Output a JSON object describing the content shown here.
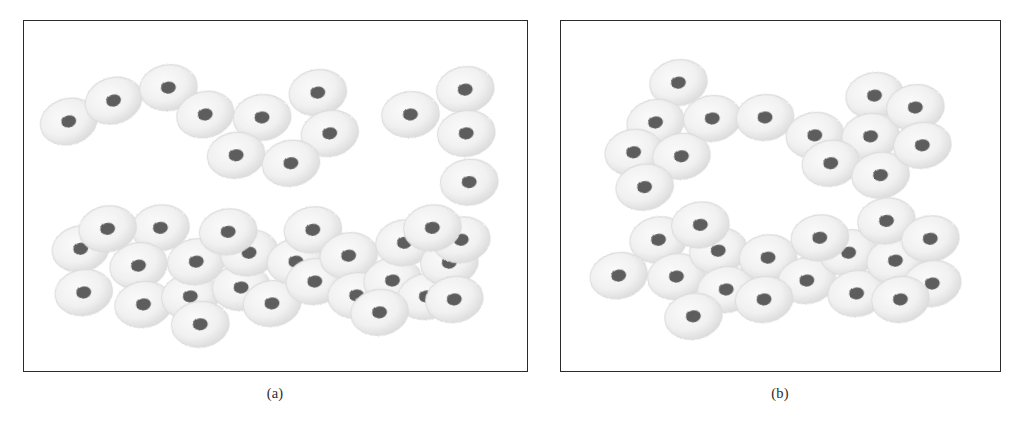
{
  "figure": {
    "background_color": "#ffffff",
    "border_color": "#2b2b2b",
    "cell_body_color": "#f1f1f1",
    "cell_edge_color": "#dcdcdc",
    "cell_nucleus_color": "#5d5d5d",
    "caption_color": "#2b2b2b",
    "cell_rx": 29,
    "cell_ry": 23,
    "nucleus_rx": 7.5,
    "nucleus_ry": 6.0
  },
  "panels": [
    {
      "id": "panel-a",
      "caption": "(a)",
      "frame": {
        "x": 23,
        "y": 20,
        "width": 505,
        "height": 352
      },
      "caption_box": {
        "x": 215,
        "y": 385,
        "width": 120
      },
      "cell_count": 39,
      "clusters": [
        {
          "name": "upper-left-chain",
          "cells": [
            {
              "cx": 68,
              "cy": 121,
              "rot": -16
            },
            {
              "cx": 113,
              "cy": 100,
              "rot": -18
            },
            {
              "cx": 168,
              "cy": 87,
              "rot": -8
            },
            {
              "cx": 205,
              "cy": 114,
              "rot": -14
            },
            {
              "cx": 262,
              "cy": 117,
              "rot": -6
            },
            {
              "cx": 318,
              "cy": 92,
              "rot": -10
            },
            {
              "cx": 330,
              "cy": 133,
              "rot": -12
            },
            {
              "cx": 236,
              "cy": 155,
              "rot": -8
            },
            {
              "cx": 291,
              "cy": 163,
              "rot": -10
            }
          ]
        },
        {
          "name": "upper-right-group",
          "cells": [
            {
              "cx": 411,
              "cy": 114,
              "rot": -6
            },
            {
              "cx": 466,
              "cy": 89,
              "rot": -10
            },
            {
              "cx": 467,
              "cy": 133,
              "rot": -8
            },
            {
              "cx": 470,
              "cy": 182,
              "rot": -6
            }
          ]
        },
        {
          "name": "lower-band",
          "cells": [
            {
              "cx": 80,
              "cy": 249,
              "rot": -12
            },
            {
              "cx": 83,
              "cy": 293,
              "rot": -10
            },
            {
              "cx": 160,
              "cy": 228,
              "rot": -8
            },
            {
              "cx": 138,
              "cy": 266,
              "rot": -12
            },
            {
              "cx": 143,
              "cy": 305,
              "rot": -10
            },
            {
              "cx": 190,
              "cy": 297,
              "rot": -8
            },
            {
              "cx": 196,
              "cy": 262,
              "rot": -10
            },
            {
              "cx": 241,
              "cy": 288,
              "rot": -6
            },
            {
              "cx": 249,
              "cy": 253,
              "rot": -10
            },
            {
              "cx": 272,
              "cy": 304,
              "rot": -8
            },
            {
              "cx": 296,
              "cy": 262,
              "rot": -8
            },
            {
              "cx": 313,
              "cy": 230,
              "rot": -10
            },
            {
              "cx": 315,
              "cy": 282,
              "rot": -8
            },
            {
              "cx": 349,
              "cy": 256,
              "rot": -10
            },
            {
              "cx": 357,
              "cy": 296,
              "rot": -6
            },
            {
              "cx": 393,
              "cy": 281,
              "rot": -10
            },
            {
              "cx": 405,
              "cy": 243,
              "rot": -8
            },
            {
              "cx": 427,
              "cy": 297,
              "rot": -10
            },
            {
              "cx": 450,
              "cy": 263,
              "rot": -8
            },
            {
              "cx": 455,
              "cy": 300,
              "rot": -10
            },
            {
              "cx": 462,
              "cy": 240,
              "rot": -8
            },
            {
              "cx": 228,
              "cy": 232,
              "rot": -8
            },
            {
              "cx": 380,
              "cy": 313,
              "rot": -8
            },
            {
              "cx": 107,
              "cy": 229,
              "rot": -10
            },
            {
              "cx": 433,
              "cy": 228,
              "rot": -8
            },
            {
              "cx": 200,
              "cy": 325,
              "rot": -6
            }
          ]
        }
      ]
    },
    {
      "id": "panel-b",
      "caption": "(b)",
      "frame": {
        "x": 560,
        "y": 20,
        "width": 441,
        "height": 352
      },
      "caption_box": {
        "x": 720,
        "y": 385,
        "width": 120
      },
      "cell_count": 32,
      "clusters": [
        {
          "name": "upper-horseshoe",
          "cells": [
            {
              "cx": 678,
              "cy": 82,
              "rot": -10
            },
            {
              "cx": 655,
              "cy": 122,
              "rot": -12
            },
            {
              "cx": 712,
              "cy": 118,
              "rot": -8
            },
            {
              "cx": 765,
              "cy": 117,
              "rot": -6
            },
            {
              "cx": 633,
              "cy": 152,
              "rot": -10
            },
            {
              "cx": 681,
              "cy": 156,
              "rot": -8
            },
            {
              "cx": 644,
              "cy": 187,
              "rot": -10
            },
            {
              "cx": 815,
              "cy": 135,
              "rot": -8
            },
            {
              "cx": 875,
              "cy": 95,
              "rot": -10
            },
            {
              "cx": 871,
              "cy": 136,
              "rot": -8
            },
            {
              "cx": 916,
              "cy": 107,
              "rot": -8
            },
            {
              "cx": 831,
              "cy": 163,
              "rot": -10
            },
            {
              "cx": 881,
              "cy": 175,
              "rot": -8
            },
            {
              "cx": 923,
              "cy": 145,
              "rot": -8
            }
          ]
        },
        {
          "name": "lower-horseshoe",
          "cells": [
            {
              "cx": 658,
              "cy": 240,
              "rot": -10
            },
            {
              "cx": 618,
              "cy": 276,
              "rot": -12
            },
            {
              "cx": 676,
              "cy": 277,
              "rot": -8
            },
            {
              "cx": 718,
              "cy": 251,
              "rot": -10
            },
            {
              "cx": 726,
              "cy": 290,
              "rot": -8
            },
            {
              "cx": 768,
              "cy": 258,
              "rot": -6
            },
            {
              "cx": 693,
              "cy": 317,
              "rot": -10
            },
            {
              "cx": 807,
              "cy": 281,
              "rot": -8
            },
            {
              "cx": 849,
              "cy": 253,
              "rot": -10
            },
            {
              "cx": 857,
              "cy": 294,
              "rot": -8
            },
            {
              "cx": 896,
              "cy": 261,
              "rot": -10
            },
            {
              "cx": 887,
              "cy": 221,
              "rot": -8
            },
            {
              "cx": 931,
              "cy": 239,
              "rot": -8
            },
            {
              "cx": 933,
              "cy": 284,
              "rot": -10
            },
            {
              "cx": 901,
              "cy": 300,
              "rot": -8
            },
            {
              "cx": 700,
              "cy": 225,
              "rot": -8
            },
            {
              "cx": 764,
              "cy": 300,
              "rot": -8
            },
            {
              "cx": 820,
              "cy": 238,
              "rot": -8
            }
          ]
        }
      ]
    }
  ]
}
